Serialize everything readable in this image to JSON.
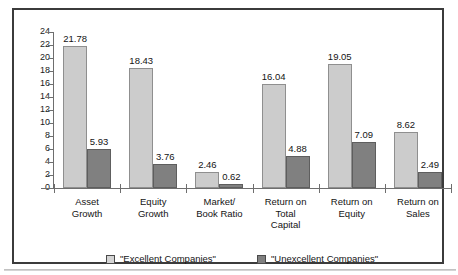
{
  "chart_data": {
    "type": "bar",
    "title": "",
    "xlabel": "",
    "ylabel": "",
    "ylim": [
      0,
      24
    ],
    "ytick_step": 2,
    "yticks": [
      0,
      2,
      4,
      6,
      8,
      10,
      12,
      14,
      16,
      18,
      20,
      22,
      24
    ],
    "grid": false,
    "legend_position": "bottom",
    "categories": [
      "Asset\nGrowth",
      "Equity\nGrowth",
      "Market/\nBook Ratio",
      "Return on\nTotal\nCapital",
      "Return on\nEquity",
      "Return on\nSales"
    ],
    "category_lines": [
      [
        "Asset",
        "Growth"
      ],
      [
        "Equity",
        "Growth"
      ],
      [
        "Market/",
        "Book Ratio"
      ],
      [
        "Return on",
        "Total",
        "Capital"
      ],
      [
        "Return on",
        "Equity"
      ],
      [
        "Return on",
        "Sales"
      ]
    ],
    "series": [
      {
        "name": "\"Excellent Companies\"",
        "color": "#cccccc",
        "values": [
          21.78,
          18.43,
          2.46,
          16.04,
          19.05,
          8.62
        ],
        "labels": [
          "21.78",
          "18.43",
          "2.46",
          "16.04",
          "19.05",
          "8.62"
        ]
      },
      {
        "name": "\"Unexcellent Companies\"",
        "color": "#808080",
        "values": [
          5.93,
          3.76,
          0.62,
          4.88,
          7.09,
          2.49
        ],
        "labels": [
          "5.93",
          "3.76",
          "0.62",
          "4.88",
          "7.09",
          "2.49"
        ]
      }
    ]
  },
  "legend": {
    "items": [
      {
        "label": "\"Excellent Companies\"",
        "swatch": "light"
      },
      {
        "label": "\"Unexcellent Companies\"",
        "swatch": "dark"
      }
    ]
  },
  "colors": {
    "series_light": "#cccccc",
    "series_dark": "#808080",
    "frame": "#3b3b3b",
    "axis": "#6e6e6e",
    "text": "#141414",
    "background": "#ffffff"
  }
}
